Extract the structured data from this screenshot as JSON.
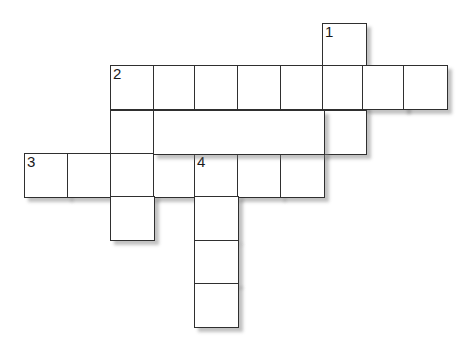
{
  "puzzle": {
    "type": "crossword-grid",
    "title": "",
    "background_color": "#ffffff",
    "cell_border_color": "#2f2f2f",
    "cell_fill_color": "#ffffff",
    "shadow_color": "#b4b4b4",
    "cell_size": 43,
    "origin_x": 24,
    "origin_y": 23,
    "columns": 10,
    "rows": 7,
    "column_x": [
      24,
      67,
      110,
      153,
      194,
      237,
      280,
      322,
      362,
      403
    ],
    "row_y": [
      23,
      65,
      110,
      153,
      196,
      240,
      283
    ],
    "clue_numbers": [
      "1",
      "2",
      "3",
      "4"
    ],
    "cells": [
      {
        "row": 0,
        "col": 7,
        "number": "1",
        "letter": ""
      },
      {
        "row": 1,
        "col": 2,
        "number": "2",
        "letter": ""
      },
      {
        "row": 1,
        "col": 3,
        "number": "",
        "letter": ""
      },
      {
        "row": 1,
        "col": 4,
        "number": "",
        "letter": ""
      },
      {
        "row": 1,
        "col": 5,
        "number": "",
        "letter": ""
      },
      {
        "row": 1,
        "col": 6,
        "number": "",
        "letter": ""
      },
      {
        "row": 1,
        "col": 7,
        "number": "",
        "letter": ""
      },
      {
        "row": 1,
        "col": 8,
        "number": "",
        "letter": ""
      },
      {
        "row": 1,
        "col": 9,
        "number": "",
        "letter": ""
      },
      {
        "row": 2,
        "col": 2,
        "number": "",
        "letter": ""
      },
      {
        "row": 2,
        "col": 7,
        "number": "",
        "letter": ""
      },
      {
        "row": 3,
        "col": 0,
        "number": "3",
        "letter": ""
      },
      {
        "row": 3,
        "col": 1,
        "number": "",
        "letter": ""
      },
      {
        "row": 3,
        "col": 2,
        "number": "",
        "letter": ""
      },
      {
        "row": 3,
        "col": 3,
        "number": "",
        "letter": ""
      },
      {
        "row": 3,
        "col": 4,
        "number": "4",
        "letter": ""
      },
      {
        "row": 3,
        "col": 5,
        "number": "",
        "letter": ""
      },
      {
        "row": 3,
        "col": 6,
        "number": "",
        "letter": ""
      },
      {
        "row": 4,
        "col": 2,
        "number": "",
        "letter": ""
      },
      {
        "row": 4,
        "col": 4,
        "number": "",
        "letter": ""
      },
      {
        "row": 5,
        "col": 4,
        "number": "",
        "letter": ""
      },
      {
        "row": 6,
        "col": 4,
        "number": "",
        "letter": ""
      }
    ]
  }
}
